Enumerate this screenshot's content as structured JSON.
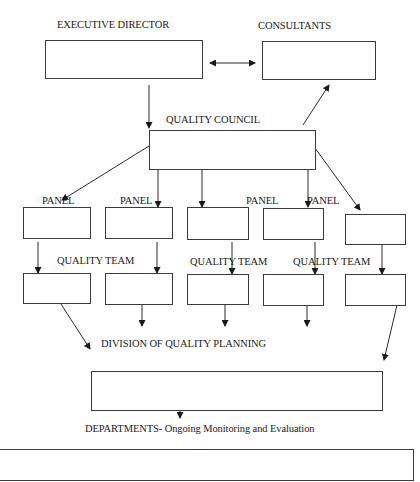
{
  "diagram": {
    "type": "organizational-flowchart",
    "colors": {
      "stroke": "#2a2a2a",
      "background": "#ffffff",
      "text": "#1a1a1a"
    },
    "nodes": {
      "executive_director": {
        "label": "EXECUTIVE DIRECTOR"
      },
      "consultants": {
        "label": "CONSULTANTS"
      },
      "quality_council": {
        "label": "QUALITY COUNCIL"
      },
      "division": {
        "label": "DIVISION OF QUALITY PLANNING"
      },
      "departments": {
        "label": "DEPARTMENTS- Ongoing Monitoring and Evaluation"
      }
    },
    "panel_labels": [
      "PANEL",
      "PANEL",
      "PANEL",
      "PANEL"
    ],
    "team_labels": [
      "QUALITY TEAM",
      "QUALITY TEAM",
      "QUALITY TEAM"
    ],
    "edges": [
      {
        "from": "executive_director",
        "to": "consultants",
        "kind": "bidirectional"
      },
      {
        "from": "executive_director",
        "to": "quality_council",
        "kind": "arrow"
      },
      {
        "from": "quality_council",
        "to": "consultants",
        "kind": "arrow"
      },
      {
        "from": "quality_council",
        "to": "panel_1",
        "kind": "arrow"
      },
      {
        "from": "quality_council",
        "to": "panel_2",
        "kind": "arrow"
      },
      {
        "from": "quality_council",
        "to": "panel_3",
        "kind": "arrow"
      },
      {
        "from": "quality_council",
        "to": "panel_4",
        "kind": "arrow"
      },
      {
        "from": "quality_council",
        "to": "panel_5",
        "kind": "arrow"
      },
      {
        "from": "panel_1",
        "to": "team_1",
        "kind": "arrow"
      },
      {
        "from": "panel_2",
        "to": "team_2",
        "kind": "arrow"
      },
      {
        "from": "panel_3",
        "to": "team_3",
        "kind": "arrow"
      },
      {
        "from": "panel_4",
        "to": "team_4",
        "kind": "arrow"
      },
      {
        "from": "panel_5",
        "to": "team_5",
        "kind": "arrow"
      },
      {
        "from": "team_1",
        "to": "division",
        "kind": "arrow"
      },
      {
        "from": "team_2",
        "to": "division",
        "kind": "arrow"
      },
      {
        "from": "team_3",
        "to": "division",
        "kind": "arrow"
      },
      {
        "from": "team_4",
        "to": "division",
        "kind": "arrow"
      },
      {
        "from": "team_5",
        "to": "division",
        "kind": "arrow"
      },
      {
        "from": "division",
        "to": "departments",
        "kind": "arrow"
      }
    ]
  }
}
